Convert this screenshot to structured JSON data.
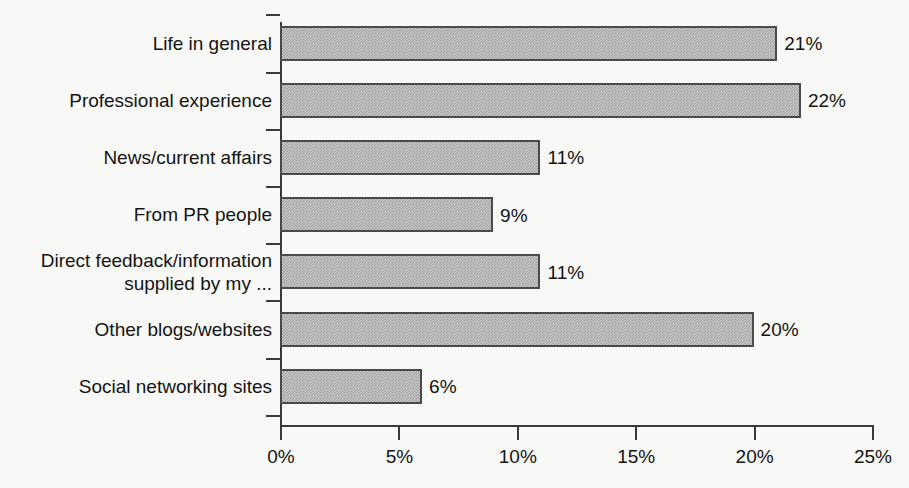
{
  "chart_data": {
    "type": "bar",
    "orientation": "horizontal",
    "title": "",
    "subtitle": "",
    "xlabel": "",
    "ylabel": "",
    "categories": [
      "Life in general",
      "Professional experience",
      "News/current affairs",
      "From PR people",
      "Direct feedback/information supplied by my ...",
      "Other blogs/websites",
      "Social networking sites"
    ],
    "values": [
      21,
      22,
      11,
      9,
      11,
      20,
      6
    ],
    "data_labels": [
      "21%",
      "22%",
      "11%",
      "9%",
      "11%",
      "20%",
      "6%"
    ],
    "xlim": [
      0,
      25
    ],
    "xticks": [
      0,
      5,
      10,
      15,
      20,
      25
    ],
    "xtick_labels": [
      "0%",
      "5%",
      "10%",
      "15%",
      "20%",
      "25%"
    ],
    "grid": false,
    "legend": null,
    "series_color": "#c9c9c9",
    "series_border_color": "#4a4a4a",
    "axis_color": "#3a3a3a",
    "text_color": "#141414",
    "background_color": "#f8f8f6"
  },
  "category_label_lines": [
    [
      "Life in general"
    ],
    [
      "Professional experience"
    ],
    [
      "News/current affairs"
    ],
    [
      "From PR people"
    ],
    [
      "Direct feedback/information",
      "supplied by my ..."
    ],
    [
      "Other blogs/websites"
    ],
    [
      "Social networking sites"
    ]
  ],
  "scan_artifacts": {
    "top_left": "",
    "top_right": "",
    "bottom_left": "",
    "bottom_right": ""
  }
}
